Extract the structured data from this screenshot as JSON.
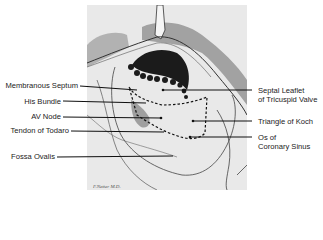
{
  "figure": {
    "signature": "F. Netter-like artist signature (illegible)",
    "colors": {
      "background": "#ffffff",
      "panel": "#e9e9e9",
      "ink": "#1a1a1a",
      "leader": "#111111"
    }
  },
  "labels": {
    "left": [
      {
        "id": "membranous-septum",
        "text": "Membranous Septum"
      },
      {
        "id": "his-bundle",
        "text": "His Bundle"
      },
      {
        "id": "av-node",
        "text": "AV Node"
      },
      {
        "id": "tendon-of-todaro",
        "text": "Tendon of Todaro"
      },
      {
        "id": "fossa-ovalis",
        "text": "Fossa Ovalis"
      }
    ],
    "right": [
      {
        "id": "septal-leaflet",
        "line1": "Septal Leaflet",
        "line2": "of Tricuspid Valve"
      },
      {
        "id": "triangle-of-koch",
        "line1": "Triangle of Koch"
      },
      {
        "id": "os-coronary-sinus",
        "line1": "Os of",
        "line2": "Coronary Sinus"
      }
    ]
  },
  "signature_text": "F. Netter M.D."
}
